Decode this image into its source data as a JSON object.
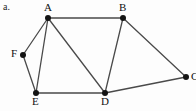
{
  "figure": {
    "caption": "a.",
    "background_color": "#fdfdfd",
    "edge_color": "#4a4a4a",
    "vertex_color": "#141414",
    "label_color": "#111111",
    "width": 196,
    "height": 111
  },
  "graph": {
    "type": "undirected-graph",
    "vertices": [
      {
        "id": "A",
        "label": "A",
        "x": 48,
        "y": 18,
        "label_x": 44,
        "label_y": 2,
        "label_pos": "above"
      },
      {
        "id": "B",
        "label": "B",
        "x": 123,
        "y": 18,
        "label_x": 119,
        "label_y": 2,
        "label_pos": "above"
      },
      {
        "id": "C",
        "label": "C",
        "x": 186,
        "y": 77,
        "label_x": 191,
        "label_y": 71,
        "label_pos": "right"
      },
      {
        "id": "D",
        "label": "D",
        "x": 105,
        "y": 93,
        "label_x": 101,
        "label_y": 96,
        "label_pos": "below"
      },
      {
        "id": "E",
        "label": "E",
        "x": 36,
        "y": 93,
        "label_x": 32,
        "label_y": 96,
        "label_pos": "below"
      },
      {
        "id": "F",
        "label": "F",
        "x": 23,
        "y": 55,
        "label_x": 11,
        "label_y": 48,
        "label_pos": "left"
      }
    ],
    "edges": [
      {
        "from": "A",
        "to": "B"
      },
      {
        "from": "A",
        "to": "F"
      },
      {
        "from": "A",
        "to": "E"
      },
      {
        "from": "A",
        "to": "D"
      },
      {
        "from": "F",
        "to": "E"
      },
      {
        "from": "E",
        "to": "D"
      },
      {
        "from": "B",
        "to": "D"
      },
      {
        "from": "B",
        "to": "C"
      },
      {
        "from": "C",
        "to": "D"
      }
    ]
  }
}
